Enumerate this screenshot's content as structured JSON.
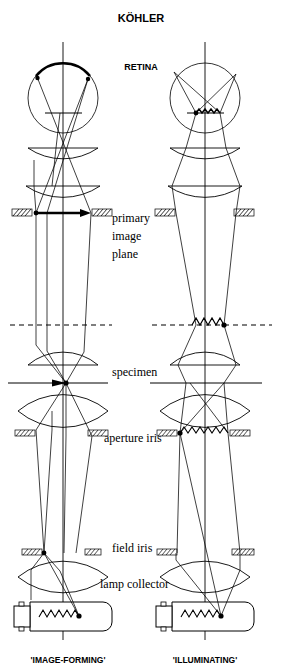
{
  "figure": {
    "title": "KÖHLER",
    "retina_label": "RETINA",
    "labels": {
      "primary_image_plane_1": "primary",
      "primary_image_plane_2": "image",
      "primary_image_plane_3": "plane",
      "specimen": "specimen",
      "aperture_iris": "aperture iris",
      "field_iris": "field iris",
      "lamp_collector": "lamp collector"
    },
    "columns": [
      {
        "id": "image-forming",
        "caption": "'IMAGE-FORMING'"
      },
      {
        "id": "illuminating",
        "caption": "'ILLUMINATING'"
      }
    ],
    "colors": {
      "ink": "#000000",
      "background": "#ffffff"
    },
    "components": [
      "eye",
      "retina",
      "eye-lens",
      "eyepiece-lens",
      "primary-image-plane",
      "dashed-plane",
      "objective-lens",
      "specimen-plane",
      "condenser-lens",
      "aperture-iris",
      "field-iris",
      "lamp-collector-lens",
      "lamp"
    ]
  }
}
